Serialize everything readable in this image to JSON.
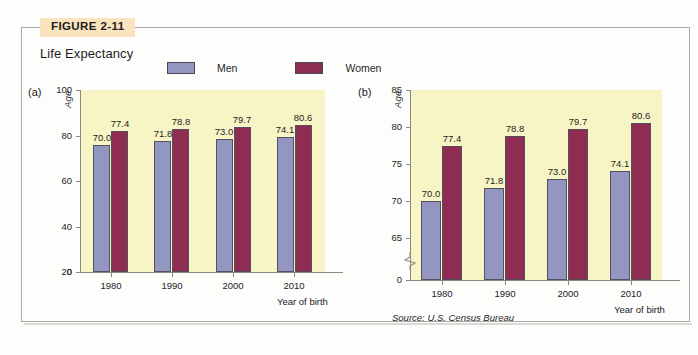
{
  "figure": {
    "badge": "FIGURE 2-11",
    "title": "Life Expectancy",
    "source": "Source: U.S. Census Bureau"
  },
  "legend": {
    "items": [
      {
        "label": "Men",
        "color": "#9396c0"
      },
      {
        "label": "Women",
        "color": "#8e2c51"
      }
    ]
  },
  "colors": {
    "men": "#9396c0",
    "women": "#8e2c51",
    "plot_background": "#f7f5c6",
    "badge_background": "#fae3bf",
    "axis": "#8a8a7e",
    "bar_outline": "#54505e"
  },
  "chart_data": [
    {
      "id": "a",
      "panel_tag": "(a)",
      "type": "bar",
      "title": "Life Expectancy",
      "xlabel": "Year of birth",
      "ylabel": "Age",
      "categories": [
        "1980",
        "1990",
        "2000",
        "2010"
      ],
      "series": [
        {
          "name": "Men",
          "values": [
            70.0,
            71.8,
            73.0,
            74.1
          ]
        },
        {
          "name": "Women",
          "values": [
            77.4,
            78.8,
            79.7,
            80.6
          ]
        }
      ],
      "value_labels": {
        "Men": [
          "70.0",
          "71.8",
          "73.0",
          "74.1"
        ],
        "Women": [
          "77.4",
          "78.8",
          "79.7",
          "80.6"
        ]
      },
      "yticks": [
        0,
        20,
        40,
        60,
        80,
        100
      ],
      "ytick_labels": [
        "0",
        "20",
        "40",
        "60",
        "80",
        "100"
      ],
      "ylim": [
        0,
        100
      ],
      "axis_break": false,
      "grid": false,
      "legend_position": "top-center"
    },
    {
      "id": "b",
      "panel_tag": "(b)",
      "type": "bar",
      "title": "Life Expectancy",
      "xlabel": "Year of birth",
      "ylabel": "Age",
      "categories": [
        "1980",
        "1990",
        "2000",
        "2010"
      ],
      "series": [
        {
          "name": "Men",
          "values": [
            70.0,
            71.8,
            73.0,
            74.1
          ]
        },
        {
          "name": "Women",
          "values": [
            77.4,
            78.8,
            79.7,
            80.6
          ]
        }
      ],
      "value_labels": {
        "Men": [
          "70.0",
          "71.8",
          "73.0",
          "74.1"
        ],
        "Women": [
          "77.4",
          "78.8",
          "79.7",
          "80.6"
        ]
      },
      "yticks": [
        0,
        65,
        70,
        75,
        80,
        85
      ],
      "ytick_labels": [
        "0",
        "65",
        "70",
        "75",
        "80",
        "85"
      ],
      "ylim": [
        65,
        85
      ],
      "axis_break": true,
      "grid": false,
      "legend_position": "top-center"
    }
  ]
}
